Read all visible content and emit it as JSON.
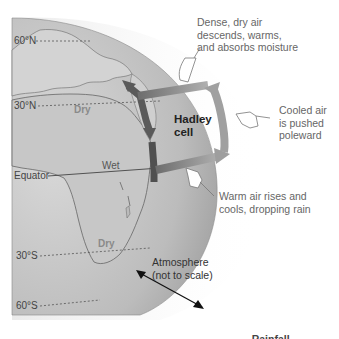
{
  "diagram": {
    "title": "Hadley cell",
    "cell_label": [
      "Hadley",
      "cell"
    ],
    "latitudes": [
      {
        "label": "60°N",
        "y": 41
      },
      {
        "label": "30°N",
        "y": 106
      },
      {
        "label": "Equator",
        "y": 176
      },
      {
        "label": "30°S",
        "y": 256
      },
      {
        "label": "60°S",
        "y": 306
      }
    ],
    "regions": [
      {
        "label": "Dry",
        "name": "dry-north"
      },
      {
        "label": "Wet",
        "name": "wet-equator"
      },
      {
        "label": "Dry",
        "name": "dry-south"
      }
    ],
    "annotations": {
      "descend": [
        "Dense, dry air",
        "descends, warms,",
        "and absorbs moisture"
      ],
      "poleward": [
        "Cooled air",
        "is pushed",
        "poleward"
      ],
      "rise": [
        "Warm air rises and",
        "cools, dropping rain"
      ],
      "atmosphere": [
        "Atmosphere",
        "(not to scale)"
      ]
    },
    "footer_partial": "... Rainfall ...",
    "colors": {
      "globe_fill": "#bdbdbd",
      "land": "#cfcfcf",
      "atmosphere": "#f0f0f0",
      "arrow_dark": "#555555",
      "arrow_light": "#9a9a9a"
    }
  }
}
